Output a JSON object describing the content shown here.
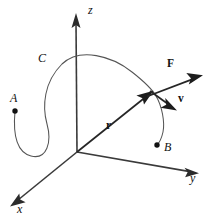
{
  "figure": {
    "type": "vector-calculus-3d-diagram",
    "width": 208,
    "height": 223,
    "background_color": "#ffffff"
  },
  "colors": {
    "axis": "#3a3a3a",
    "curve": "#555555",
    "vector": "#262626",
    "point": "#111111",
    "label": "#111111"
  },
  "axes": [
    {
      "name": "z-axis",
      "label": "z",
      "style": "italic",
      "label_x": 88,
      "label_y": 7,
      "from_x": 77,
      "from_y": 152,
      "to_x": 76,
      "to_y": 14,
      "arrow": "end"
    },
    {
      "name": "y-axis",
      "label": "y",
      "style": "italic",
      "label_x": 190,
      "label_y": 178,
      "from_x": 77,
      "from_y": 152,
      "to_x": 197,
      "to_y": 173,
      "arrow": "end"
    },
    {
      "name": "x-axis",
      "label": "x",
      "style": "italic",
      "label_x": 17,
      "label_y": 209,
      "from_x": 77,
      "from_y": 152,
      "to_x": 11,
      "to_y": 206,
      "arrow": "end"
    }
  ],
  "points": [
    {
      "name": "point-a",
      "label": "A",
      "style": "italic",
      "dot_x": 15,
      "dot_y": 111,
      "dot_r": 2.6,
      "label_x": 10,
      "label_y": 93
    },
    {
      "name": "point-b",
      "label": "B",
      "style": "italic",
      "dot_x": 157,
      "dot_y": 145,
      "dot_r": 2.6,
      "label_x": 163,
      "label_y": 142
    }
  ],
  "curve": {
    "name": "curve-c",
    "label": "C",
    "style": "italic",
    "label_x": 38,
    "label_y": 55,
    "path": "M 15 111 C 13 133, 16 152, 31 156 C 47 160, 52 142, 47 124 C 42 106, 44 82, 62 64 C 80 47, 112 56, 132 72 C 146 83, 152 89, 156 96 C 162 106, 165 122, 163 132 C 161 141, 159 143, 157 145"
  },
  "vectors": [
    {
      "name": "position-vector-r",
      "label": "r",
      "style": "bold",
      "label_x": 106,
      "label_y": 123,
      "from_x": 77,
      "from_y": 152,
      "to_x": 152,
      "to_y": 92
    },
    {
      "name": "force-vector-f",
      "label": "F",
      "style": "bold",
      "label_x": 168,
      "label_y": 64,
      "from_x": 148,
      "from_y": 96,
      "to_x": 202,
      "to_y": 76
    },
    {
      "name": "velocity-vector-v",
      "label": "v",
      "style": "bold",
      "label_x": 179,
      "label_y": 97,
      "from_x": 150,
      "from_y": 91,
      "to_x": 176,
      "to_y": 110
    }
  ]
}
